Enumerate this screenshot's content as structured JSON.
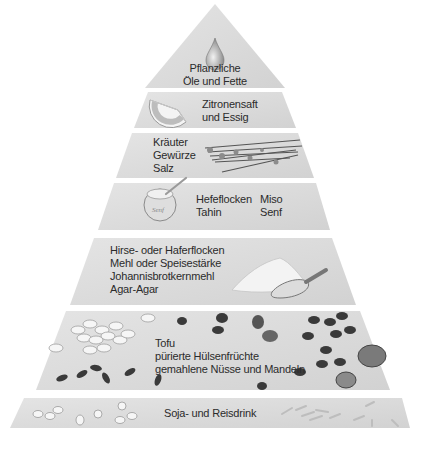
{
  "colors": {
    "layer_fill": "#d9d9d9",
    "layer_fill_light": "#e6e6e6",
    "text": "#2b2b2b",
    "background": "#ffffff"
  },
  "layers": [
    {
      "id": "oils",
      "lines": [
        "Pflanzliche",
        "Öle und Fette"
      ],
      "icon": "oil-drop-icon"
    },
    {
      "id": "lemon",
      "lines": [
        "Zitronensaft",
        "und Essig"
      ],
      "icon": "lemon-slice-icon"
    },
    {
      "id": "herbs",
      "lines": [
        "Kräuter",
        "Gewürze",
        "Salz"
      ],
      "icon": "herbs-bundle-icon"
    },
    {
      "id": "spreads",
      "col1": [
        "Hefeflocken",
        "Tahin"
      ],
      "col2": [
        "Miso",
        "Senf"
      ],
      "icon": "mustard-jar-icon",
      "jar_label": "Senf"
    },
    {
      "id": "starches",
      "lines": [
        "Hirse- oder Haferflocken",
        "Mehl oder Speisestärke",
        "Johannisbrotkernmehl",
        "Agar-Agar"
      ],
      "icon": "flour-scoop-icon"
    },
    {
      "id": "proteins",
      "lines": [
        "Tofu",
        "pürierte Hülsenfrüchte",
        "gemahlene Nüsse und Mandeln"
      ],
      "icon": "beans-nuts-icon"
    },
    {
      "id": "drinks",
      "lines": [
        "Soja- und Reisdrink"
      ],
      "icon": "soy-rice-icon"
    }
  ]
}
